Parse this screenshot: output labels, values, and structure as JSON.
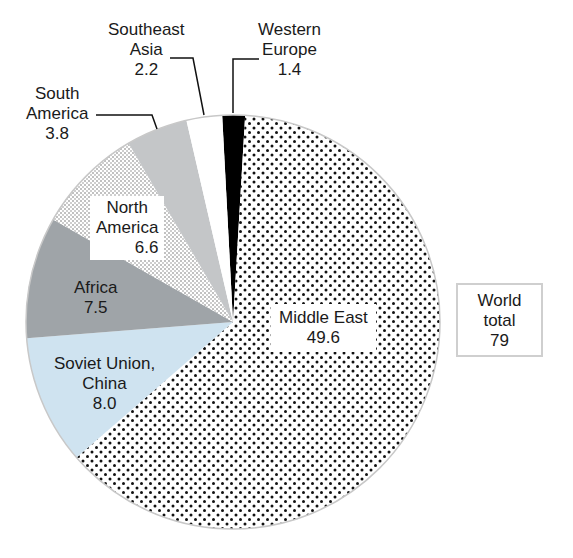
{
  "chart_data": {
    "type": "pie",
    "title": "",
    "unit": "",
    "total_label": "World total",
    "total": 79,
    "start_angle_deg": -3,
    "direction": "clockwise",
    "slices": [
      {
        "name": "Western Europe",
        "value": 1.4,
        "fill": "#000000",
        "pattern": "solid"
      },
      {
        "name": "Middle East",
        "value": 49.6,
        "fill": "#ffffff",
        "pattern": "coarse-dots"
      },
      {
        "name": "Soviet Union, China",
        "value": 8.0,
        "fill": "#cfe3f0",
        "pattern": "solid"
      },
      {
        "name": "Africa",
        "value": 7.5,
        "fill": "#9fa4a8",
        "pattern": "solid"
      },
      {
        "name": "North America",
        "value": 6.6,
        "fill": "#ffffff",
        "pattern": "fine-dots"
      },
      {
        "name": "South America",
        "value": 3.8,
        "fill": "#c4c6c8",
        "pattern": "solid"
      },
      {
        "name": "Southeast Asia",
        "value": 2.2,
        "fill": "#ffffff",
        "pattern": "solid"
      }
    ]
  },
  "labels": {
    "western_europe": {
      "line1": "Western",
      "line2": "Europe",
      "value": "1.4"
    },
    "southeast_asia": {
      "line1": "Southeast",
      "line2": "Asia",
      "value": "2.2"
    },
    "south_america": {
      "line1": "South",
      "line2": "America",
      "value": "3.8"
    },
    "north_america": {
      "line1": "North",
      "line2": "America",
      "value": "6.6"
    },
    "africa": {
      "line1": "Africa",
      "value": "7.5"
    },
    "soviet_china": {
      "line1": "Soviet Union,",
      "line2": "China",
      "value": "8.0"
    },
    "middle_east": {
      "line1": "Middle East",
      "value": "49.6"
    }
  },
  "total_box": {
    "line1": "World",
    "line2": "total",
    "value": "79"
  }
}
